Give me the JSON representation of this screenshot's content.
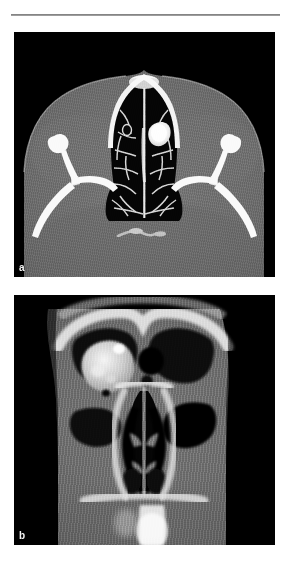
{
  "figure": {
    "kind": "medical-imaging-figure",
    "panel_count": 2,
    "background_color": "#ffffff",
    "rule_color": "#808080"
  },
  "panels": [
    {
      "label": "a",
      "modality": "CT",
      "plane": "axial",
      "window": "bone",
      "region": "paranasal sinuses",
      "background_color": "#000000",
      "soft_tissue_color": "#6e6e6e",
      "bone_color": "#f2f2f2",
      "air_color": "#050505",
      "lesion_color": "#fafafa",
      "description": "Axial bone-window CT through the ethmoid sinuses showing air cells separated by thin bony septa, with a hyperdense opacity in the right anterior ethmoid region"
    },
    {
      "label": "b",
      "modality": "CT",
      "plane": "coronal",
      "window": "soft tissue",
      "region": "sinonasal cavity",
      "background_color": "#000000",
      "soft_tissue_color": "#707070",
      "bone_color": "#ededed",
      "air_color": "#060606",
      "lesion_color": "#d8d8d8",
      "description": "Coronal CT through the nasal cavity and ethmoid sinuses showing a hyperdense mass in the left ethmoid and frontal recess with the nasal septum and turbinates below"
    }
  ]
}
